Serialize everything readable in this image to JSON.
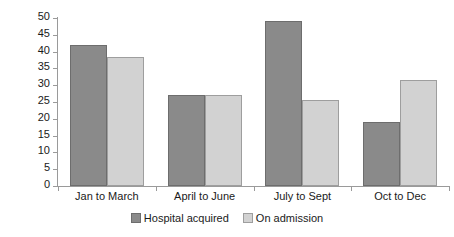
{
  "chart_data": {
    "type": "bar",
    "title": "",
    "subtitle": "",
    "xlabel": "",
    "ylabel": "Number of patients",
    "categories": [
      "Jan to March",
      "April to June",
      "July to Sept",
      "Oct to Dec"
    ],
    "series": [
      {
        "name": "Hospital acquired",
        "color": "#8a8a8a",
        "values": [
          42,
          27,
          49,
          19
        ]
      },
      {
        "name": "On admission",
        "color": "#d2d2d2",
        "values": [
          38.5,
          27,
          25.5,
          31.5
        ]
      }
    ],
    "ylim": [
      0,
      50
    ],
    "ytick_interval": 5,
    "yticks": [
      0,
      5,
      10,
      15,
      20,
      25,
      30,
      35,
      40,
      45,
      50
    ],
    "ytick_labels": [
      "0",
      "5",
      "10",
      "15",
      "20",
      "25",
      "30",
      "35",
      "40",
      "45",
      "50"
    ],
    "grid": false,
    "legend_position": "bottom",
    "legend": [
      "Hospital acquired",
      "On admission"
    ],
    "axis_color": "#9a9a9a",
    "text_color": "#1a1a1a",
    "background": "#ffffff"
  }
}
